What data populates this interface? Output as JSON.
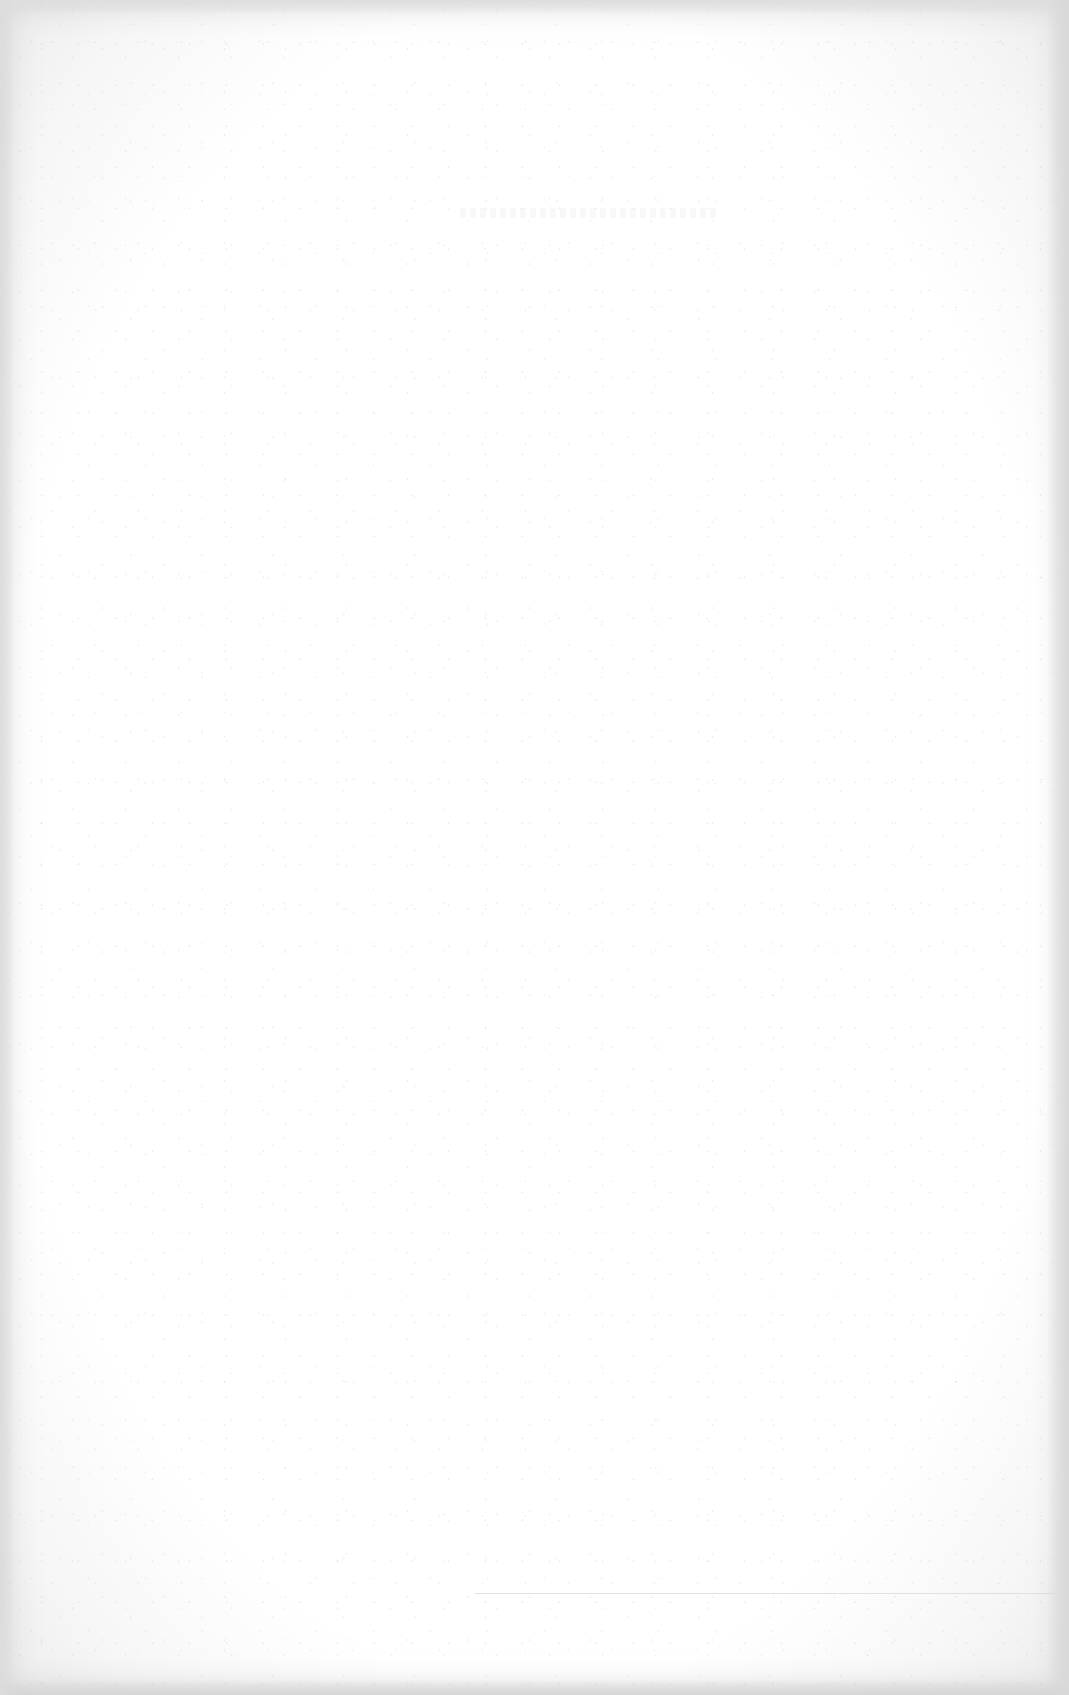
{
  "document": {
    "type": "scanned-page",
    "content": "",
    "is_blank": true
  },
  "colors": {
    "page": "#ffffff",
    "edge_shadow": "#dcdcdc",
    "rule": "#d9d9d9"
  }
}
